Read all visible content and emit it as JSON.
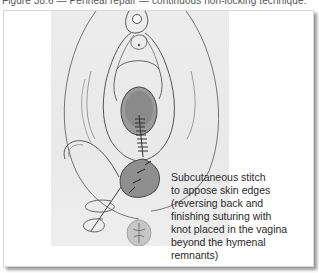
{
  "figure": {
    "caption_fragment": "Figure 38.6 — Perineal repair — continuous non-locking technique:",
    "annotation": "Subcutaneous stitch to appose skin edges (reversing back and finishing suturing with knot placed in the vagina beyond the hymenal remnants)",
    "annotation_lines": [
      "Subcutaneous stitch",
      "to appose skin edges",
      "(reversing back and",
      "finishing suturing with",
      "knot placed in the vagina",
      "beyond the hymenal",
      "remnants)"
    ],
    "colors": {
      "frame_bg": "#ffffff",
      "illustration_bg": "#ebebeb",
      "line": "#555555",
      "shadow": "#9a9a9a",
      "text": "#2a2a2a"
    }
  }
}
